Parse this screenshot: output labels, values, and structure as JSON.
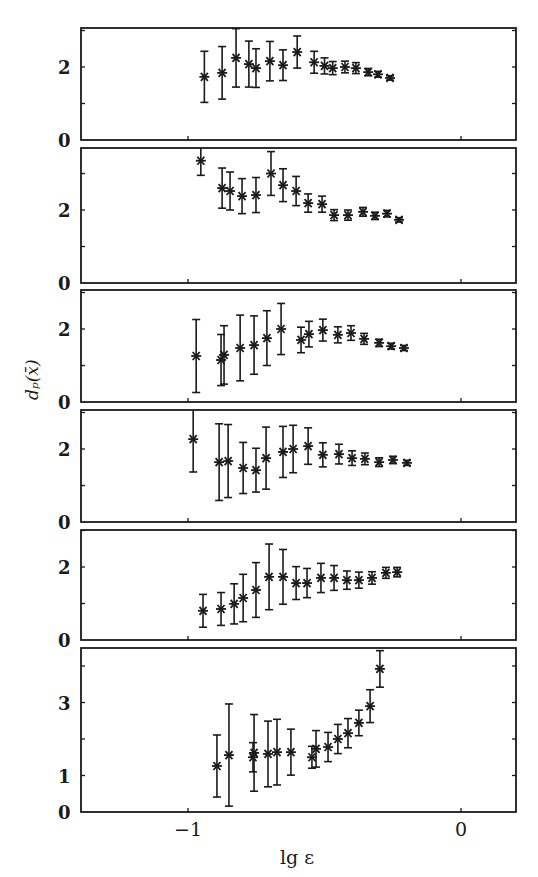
{
  "chart_data": [
    {
      "type": "scatter",
      "panel": 1,
      "ylim": [
        0,
        3.05
      ],
      "yticks": [
        0,
        2
      ],
      "series": [
        {
          "name": "dp",
          "x": [
            -0.94,
            -0.875,
            -0.824,
            -0.777,
            -0.751,
            -0.7,
            -0.652,
            -0.6,
            -0.538,
            -0.5,
            -0.47,
            -0.425,
            -0.385,
            -0.34,
            -0.304,
            -0.26
          ],
          "y": [
            1.73,
            1.84,
            2.25,
            2.08,
            1.97,
            2.16,
            2.05,
            2.41,
            2.13,
            2.03,
            1.97,
            2.0,
            1.97,
            1.86,
            1.8,
            1.7
          ],
          "err": [
            0.7,
            0.72,
            0.8,
            0.63,
            0.53,
            0.54,
            0.42,
            0.44,
            0.3,
            0.22,
            0.18,
            0.16,
            0.15,
            0.1,
            0.08,
            0.06
          ]
        }
      ]
    },
    {
      "type": "scatter",
      "panel": 2,
      "ylim": [
        0,
        3.7
      ],
      "yticks": [
        0,
        2
      ],
      "series": [
        {
          "name": "dp",
          "x": [
            -0.953,
            -0.875,
            -0.846,
            -0.802,
            -0.751,
            -0.696,
            -0.652,
            -0.604,
            -0.56,
            -0.509,
            -0.465,
            -0.414,
            -0.359,
            -0.315,
            -0.271,
            -0.227
          ],
          "y": [
            3.35,
            2.6,
            2.52,
            2.38,
            2.41,
            3.0,
            2.68,
            2.52,
            2.19,
            2.16,
            1.86,
            1.86,
            1.95,
            1.84,
            1.9,
            1.73
          ],
          "err": [
            0.4,
            0.55,
            0.52,
            0.48,
            0.48,
            0.6,
            0.45,
            0.4,
            0.25,
            0.22,
            0.15,
            0.14,
            0.12,
            0.1,
            0.09,
            0.06
          ]
        }
      ]
    },
    {
      "type": "scatter",
      "panel": 3,
      "ylim": [
        0,
        3.05
      ],
      "yticks": [
        0,
        2
      ],
      "series": [
        {
          "name": "dp",
          "x": [
            -0.97,
            -0.879,
            -0.868,
            -0.809,
            -0.758,
            -0.711,
            -0.659,
            -0.586,
            -0.557,
            -0.506,
            -0.451,
            -0.403,
            -0.355,
            -0.3,
            -0.256,
            -0.209
          ],
          "y": [
            1.26,
            1.15,
            1.29,
            1.48,
            1.56,
            1.75,
            2.0,
            1.7,
            1.86,
            1.97,
            1.84,
            1.89,
            1.73,
            1.62,
            1.53,
            1.48
          ],
          "err": [
            1.0,
            0.7,
            0.8,
            0.9,
            0.8,
            0.75,
            0.7,
            0.35,
            0.35,
            0.3,
            0.22,
            0.2,
            0.15,
            0.1,
            0.08,
            0.07
          ]
        }
      ]
    },
    {
      "type": "scatter",
      "panel": 4,
      "ylim": [
        0,
        3.05
      ],
      "yticks": [
        0,
        2
      ],
      "series": [
        {
          "name": "dp",
          "x": [
            -0.981,
            -0.886,
            -0.853,
            -0.798,
            -0.751,
            -0.714,
            -0.652,
            -0.615,
            -0.56,
            -0.506,
            -0.447,
            -0.399,
            -0.352,
            -0.3,
            -0.249,
            -0.198
          ],
          "y": [
            2.27,
            1.64,
            1.67,
            1.48,
            1.42,
            1.75,
            1.92,
            2.0,
            2.08,
            1.84,
            1.86,
            1.75,
            1.73,
            1.64,
            1.7,
            1.62
          ],
          "err": [
            0.9,
            1.05,
            1.0,
            0.7,
            0.6,
            0.85,
            0.7,
            0.65,
            0.5,
            0.33,
            0.27,
            0.2,
            0.16,
            0.12,
            0.1,
            0.07
          ]
        }
      ]
    },
    {
      "type": "scatter",
      "panel": 5,
      "ylim": [
        0,
        3.0
      ],
      "yticks": [
        0,
        2
      ],
      "series": [
        {
          "name": "dp",
          "x": [
            -0.945,
            -0.879,
            -0.831,
            -0.798,
            -0.751,
            -0.703,
            -0.652,
            -0.604,
            -0.564,
            -0.513,
            -0.465,
            -0.418,
            -0.374,
            -0.326,
            -0.275,
            -0.234
          ],
          "y": [
            0.8,
            0.85,
            0.99,
            1.15,
            1.37,
            1.73,
            1.73,
            1.56,
            1.56,
            1.7,
            1.7,
            1.64,
            1.64,
            1.7,
            1.84,
            1.86
          ],
          "err": [
            0.45,
            0.45,
            0.55,
            0.65,
            0.75,
            0.9,
            0.75,
            0.45,
            0.4,
            0.4,
            0.34,
            0.25,
            0.22,
            0.17,
            0.15,
            0.13
          ]
        }
      ]
    },
    {
      "type": "scatter",
      "panel": 6,
      "ylim": [
        0,
        4.5
      ],
      "yticks": [
        0,
        1,
        3
      ],
      "series": [
        {
          "name": "dp",
          "x": [
            -0.894,
            -0.85,
            -0.762,
            -0.758,
            -0.707,
            -0.674,
            -0.623,
            -0.546,
            -0.531,
            -0.487,
            -0.451,
            -0.414,
            -0.374,
            -0.333,
            -0.297
          ],
          "y": [
            1.26,
            1.56,
            1.5,
            1.62,
            1.59,
            1.64,
            1.64,
            1.5,
            1.73,
            1.78,
            2.0,
            2.16,
            2.44,
            2.9,
            3.92
          ],
          "err": [
            0.85,
            1.4,
            0.4,
            1.05,
            0.9,
            0.9,
            0.63,
            0.3,
            0.5,
            0.4,
            0.4,
            0.4,
            0.35,
            0.45,
            0.5
          ]
        }
      ]
    }
  ],
  "axes": {
    "xlabel": "lg ε",
    "ylabel": "dₚ(x̄)",
    "xlim": [
      -1.4,
      0.2
    ],
    "xticks": [
      {
        "value": -1,
        "label": "−1"
      },
      {
        "value": 0,
        "label": "0"
      }
    ],
    "panel_y_labels": [
      [
        {
          "v": 0,
          "label": "0"
        },
        {
          "v": 2,
          "label": "2"
        }
      ],
      [
        {
          "v": 0,
          "label": "0"
        },
        {
          "v": 2,
          "label": "2"
        }
      ],
      [
        {
          "v": 0,
          "label": "0"
        },
        {
          "v": 2,
          "label": "2"
        }
      ],
      [
        {
          "v": 0,
          "label": "0"
        },
        {
          "v": 2,
          "label": "2"
        }
      ],
      [
        {
          "v": 0,
          "label": "0"
        },
        {
          "v": 2,
          "label": "2"
        }
      ],
      [
        {
          "v": 0,
          "label": "0"
        },
        {
          "v": 1,
          "label": "1"
        },
        {
          "v": 3,
          "label": "3"
        }
      ]
    ]
  },
  "colors": {
    "ink": "#1a1a1a",
    "background": "#ffffff"
  }
}
